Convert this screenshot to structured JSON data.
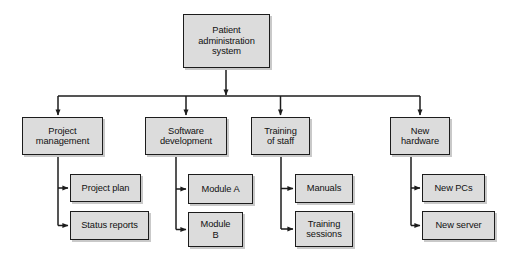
{
  "diagram": {
    "type": "work-breakdown-structure",
    "colors": {
      "node_fill": "#dcdcdc",
      "node_border": "#1c1c1c",
      "connector": "#1c1c1c",
      "shadow": "#c9c9c9",
      "background": "#ffffff"
    },
    "root": {
      "id": "patient-administration-system",
      "label": "Patient\nadministration\nsystem",
      "x": 183,
      "y": 14,
      "w": 87,
      "h": 54
    },
    "bus": {
      "y": 96,
      "x_start": 58,
      "x_end": 420,
      "stem_x": 226
    },
    "branches": [
      {
        "id": "project-management",
        "label": "Project\nmanagement",
        "x": 22,
        "y": 117,
        "w": 81,
        "h": 38,
        "drop_x": 58,
        "children": [
          {
            "id": "project-plan",
            "label": "Project plan",
            "x": 70,
            "y": 174,
            "w": 71,
            "h": 28
          },
          {
            "id": "status-reports",
            "label": "Status reports",
            "x": 70,
            "y": 211,
            "w": 79,
            "h": 29
          }
        ]
      },
      {
        "id": "software-development",
        "label": "Software\ndevelopment",
        "x": 145,
        "y": 117,
        "w": 82,
        "h": 38,
        "drop_x": 176,
        "children": [
          {
            "id": "module-a",
            "label": "Module A",
            "x": 188,
            "y": 174,
            "w": 65,
            "h": 30
          },
          {
            "id": "module-b",
            "label": "Module\nB",
            "x": 188,
            "y": 212,
            "w": 55,
            "h": 35
          }
        ]
      },
      {
        "id": "training-of-staff",
        "label": "Training\nof staff",
        "x": 251,
        "y": 117,
        "w": 59,
        "h": 38,
        "drop_x": 281,
        "children": [
          {
            "id": "manuals",
            "label": "Manuals",
            "x": 295,
            "y": 174,
            "w": 58,
            "h": 29
          },
          {
            "id": "training-sessions",
            "label": "Training\nsessions",
            "x": 295,
            "y": 211,
            "w": 58,
            "h": 36
          }
        ]
      },
      {
        "id": "new-hardware",
        "label": "New\nhardware",
        "x": 390,
        "y": 117,
        "w": 60,
        "h": 38,
        "drop_x": 411,
        "children": [
          {
            "id": "new-pcs",
            "label": "New PCs",
            "x": 422,
            "y": 174,
            "w": 63,
            "h": 28
          },
          {
            "id": "new-server",
            "label": "New server",
            "x": 422,
            "y": 211,
            "w": 73,
            "h": 29
          }
        ]
      }
    ]
  }
}
